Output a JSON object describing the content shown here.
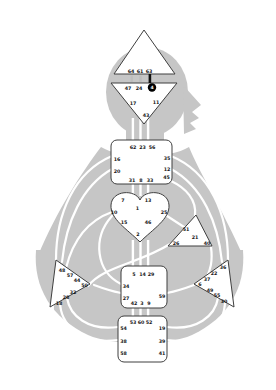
{
  "colors": {
    "background": "#ffffff",
    "body": "#c6c6c6",
    "channel": "#ffffff",
    "center_fill": "#ffffff",
    "center_border": "#3f3f3f",
    "gate_text": "#151515",
    "activated_fill": "#000000",
    "activated_text": "#ffffff",
    "gap_strip": "#bdbdbd",
    "gap_strip_dark": "#111111"
  },
  "centers": {
    "head": {
      "label": "head-center",
      "shape": "triangle-up",
      "gates": [
        "64",
        "61",
        "63"
      ]
    },
    "ajna": {
      "label": "ajna-center",
      "shape": "triangle-down",
      "gates": [
        "47",
        "24",
        "4",
        "17",
        "11",
        "43"
      ],
      "activated_gate": "4"
    },
    "throat": {
      "label": "throat-center",
      "shape": "square",
      "gates": [
        "62",
        "23",
        "56",
        "16",
        "35",
        "20",
        "12",
        "45",
        "31",
        "8",
        "33"
      ]
    },
    "g": {
      "label": "g-center",
      "shape": "heart",
      "gates": [
        "7",
        "13",
        "1",
        "10",
        "25",
        "15",
        "46",
        "2"
      ]
    },
    "ego": {
      "label": "ego-center",
      "shape": "triangle",
      "gates": [
        "51",
        "21",
        "26",
        "40"
      ]
    },
    "spleen": {
      "label": "spleen-center",
      "shape": "triangle-right",
      "gates": [
        "48",
        "57",
        "44",
        "50",
        "32",
        "28",
        "18"
      ]
    },
    "solar_plexus": {
      "label": "solar-plexus-center",
      "shape": "triangle-left",
      "gates": [
        "36",
        "22",
        "37",
        "6",
        "49",
        "55",
        "30"
      ]
    },
    "sacral": {
      "label": "sacral-center",
      "shape": "square",
      "gates": [
        "5",
        "14",
        "29",
        "34",
        "27",
        "59",
        "42",
        "3",
        "9"
      ]
    },
    "root": {
      "label": "root-center",
      "shape": "square",
      "gates": [
        "53",
        "60",
        "52",
        "54",
        "19",
        "38",
        "39",
        "58",
        "41"
      ]
    }
  }
}
